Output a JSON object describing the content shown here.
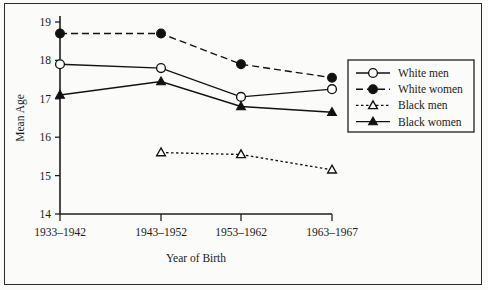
{
  "chart_data": {
    "type": "line",
    "title": "",
    "xlabel": "Year of Birth",
    "ylabel": "Mean Age",
    "categories": [
      "1933–1942",
      "1943–1952",
      "1953–1962",
      "1963–1967"
    ],
    "ylim": [
      14,
      19
    ],
    "yticks": [
      14,
      15,
      16,
      17,
      18,
      19
    ],
    "ytick_labels": [
      "14",
      "15",
      "16",
      "17",
      "18",
      "19"
    ],
    "grid": false,
    "legend_position": "right",
    "series": [
      {
        "name": "White men",
        "marker": "open-circle",
        "line_style": "solid",
        "values": [
          17.9,
          17.8,
          17.05,
          17.25
        ]
      },
      {
        "name": "White women",
        "marker": "filled-circle",
        "line_style": "dashed",
        "values": [
          18.7,
          18.7,
          17.9,
          17.55
        ]
      },
      {
        "name": "Black men",
        "marker": "open-triangle",
        "line_style": "dotted",
        "values": [
          null,
          15.6,
          15.55,
          15.15
        ]
      },
      {
        "name": "Black women",
        "marker": "filled-triangle",
        "line_style": "solid",
        "values": [
          17.1,
          17.45,
          16.8,
          16.65
        ]
      }
    ],
    "colors": {
      "ink": "#111111",
      "axis": "#1f1f1f",
      "background": "#fbfbf9"
    }
  }
}
